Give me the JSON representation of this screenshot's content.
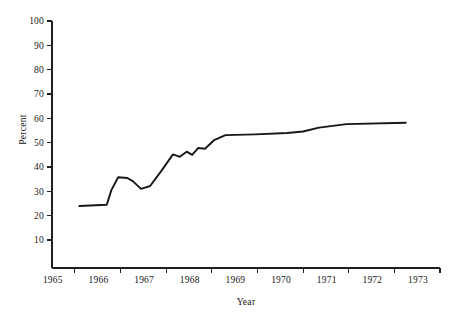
{
  "chart_data": {
    "type": "line",
    "title": "",
    "xlabel": "Year",
    "ylabel": "Percent",
    "xlim": [
      1964.75,
      1973.25
    ],
    "ylim": [
      0,
      100
    ],
    "grid": false,
    "legend": null,
    "y_ticks": [
      100,
      90,
      80,
      70,
      60,
      50,
      40,
      30,
      20,
      10
    ],
    "y_tick_labels": [
      "100",
      "90",
      "80",
      "70",
      "60",
      "50",
      "40",
      "30",
      "20",
      "10"
    ],
    "x_ticks": [
      1965.25,
      1966.25,
      1967.25,
      1968.25,
      1969.25,
      1970.25,
      1971.25,
      1972.25,
      1973.25
    ],
    "x_tick_labels": [
      "1965",
      "1966",
      "1967",
      "1968",
      "1969",
      "1970",
      "1971",
      "1972",
      "1973"
    ],
    "series": [
      {
        "name": "Percent",
        "color": "#171717",
        "x": [
          1965.35,
          1965.95,
          1966.05,
          1966.2,
          1966.4,
          1966.52,
          1966.7,
          1966.9,
          1967.15,
          1967.4,
          1967.55,
          1967.7,
          1967.82,
          1967.95,
          1968.1,
          1968.3,
          1968.55,
          1969.2,
          1969.9,
          1970.25,
          1970.6,
          1971.2,
          1972.5
        ],
        "y": [
          24.0,
          24.5,
          30.5,
          35.8,
          35.5,
          34.2,
          31.0,
          32.2,
          38.5,
          45.2,
          44.2,
          46.3,
          45.0,
          47.8,
          47.5,
          51.0,
          53.1,
          53.4,
          54.0,
          54.6,
          56.2,
          57.6,
          58.2
        ]
      }
    ]
  },
  "figure": {
    "axis_color": "#1f1f1f",
    "background": "#ffffff",
    "y_axis_title": "Percent",
    "x_axis_title": "Year"
  }
}
